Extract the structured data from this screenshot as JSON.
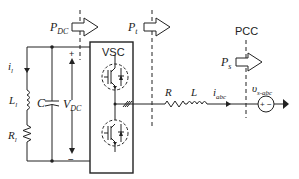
{
  "diagram": {
    "type": "circuit-schematic",
    "power_labels": {
      "p_dc": {
        "main": "P",
        "sub": "DC"
      },
      "p_t": {
        "main": "P",
        "sub": "t"
      },
      "p_s": {
        "main": "P",
        "sub": "s"
      }
    },
    "converter": {
      "label": "VSC"
    },
    "pcc": {
      "label": "PCC"
    },
    "dc_side": {
      "current": {
        "main": "i",
        "sub": "l"
      },
      "inductor": {
        "main": "L",
        "sub": "l"
      },
      "resistor": {
        "main": "R",
        "sub": "l"
      },
      "capacitor": {
        "main": "C"
      },
      "voltage": {
        "main": "V",
        "sub": "DC"
      },
      "plus": "+",
      "minus": "−"
    },
    "ac_side": {
      "resistor": {
        "main": "R"
      },
      "inductor": {
        "main": "L"
      },
      "current": {
        "main": "i",
        "sub": "abc"
      },
      "source_voltage": {
        "main": "υ",
        "sub": "s-abc"
      },
      "source_plus": "+",
      "source_minus": "−"
    },
    "colors": {
      "line": "#222222",
      "background": "#ffffff"
    }
  }
}
